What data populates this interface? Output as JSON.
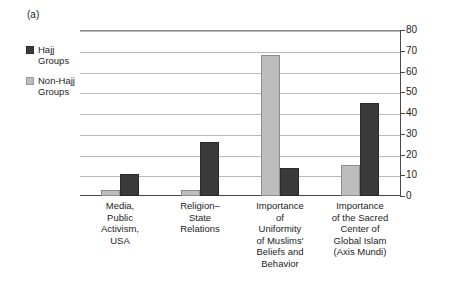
{
  "panel": {
    "label": "(a)"
  },
  "legend": {
    "position": "left-inside",
    "entries": [
      {
        "label": "Hajj\nGroups",
        "color": "#3a3a3a",
        "swatch": "dark-square-swatch"
      },
      {
        "label": "Non-Hajj\nGroups",
        "color": "#bdbdbd",
        "swatch": "light-square-swatch"
      }
    ]
  },
  "chart_data": {
    "type": "bar",
    "title": "",
    "subtitle": "",
    "xlabel": "",
    "ylabel": "",
    "ylim": [
      0,
      80
    ],
    "yticks": [
      0,
      10,
      20,
      30,
      40,
      50,
      60,
      70,
      80
    ],
    "ytick_labels": [
      "0",
      "10",
      "20",
      "30",
      "40",
      "50",
      "60",
      "70",
      "80"
    ],
    "y_axis_position": "right",
    "grid": true,
    "grid_axis": "y",
    "legend_position": "upper-left-outside",
    "bar_order_in_group": [
      "Non-Hajj Groups",
      "Hajj Groups"
    ],
    "categories": [
      "Media,\nPublic\nActivism,\nUSA",
      "Religion–\nState\nRelations",
      "Importance\nof\nUniformity\nof Muslims'\nBeliefs and\nBehavior",
      "Importance\nof the Sacred\nCenter of\nGlobal Islam\n(Axis Mundi)"
    ],
    "series": [
      {
        "name": "Non-Hajj Groups",
        "color": "#bdbdbd",
        "values": [
          3,
          3,
          68,
          15
        ]
      },
      {
        "name": "Hajj Groups",
        "color": "#3a3a3a",
        "values": [
          10.5,
          26,
          13.5,
          45
        ]
      }
    ]
  }
}
